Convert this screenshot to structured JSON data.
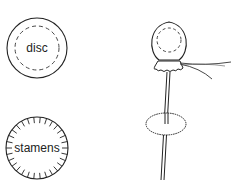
{
  "diagram": {
    "labels": {
      "disc": "disc",
      "stamens": "stamens"
    },
    "colors": {
      "stroke": "#222222",
      "background": "#ffffff"
    },
    "parts": [
      {
        "name": "disc-view",
        "label": "disc"
      },
      {
        "name": "stamens-view",
        "label": "stamens"
      },
      {
        "name": "assembled-model",
        "label": ""
      }
    ]
  }
}
